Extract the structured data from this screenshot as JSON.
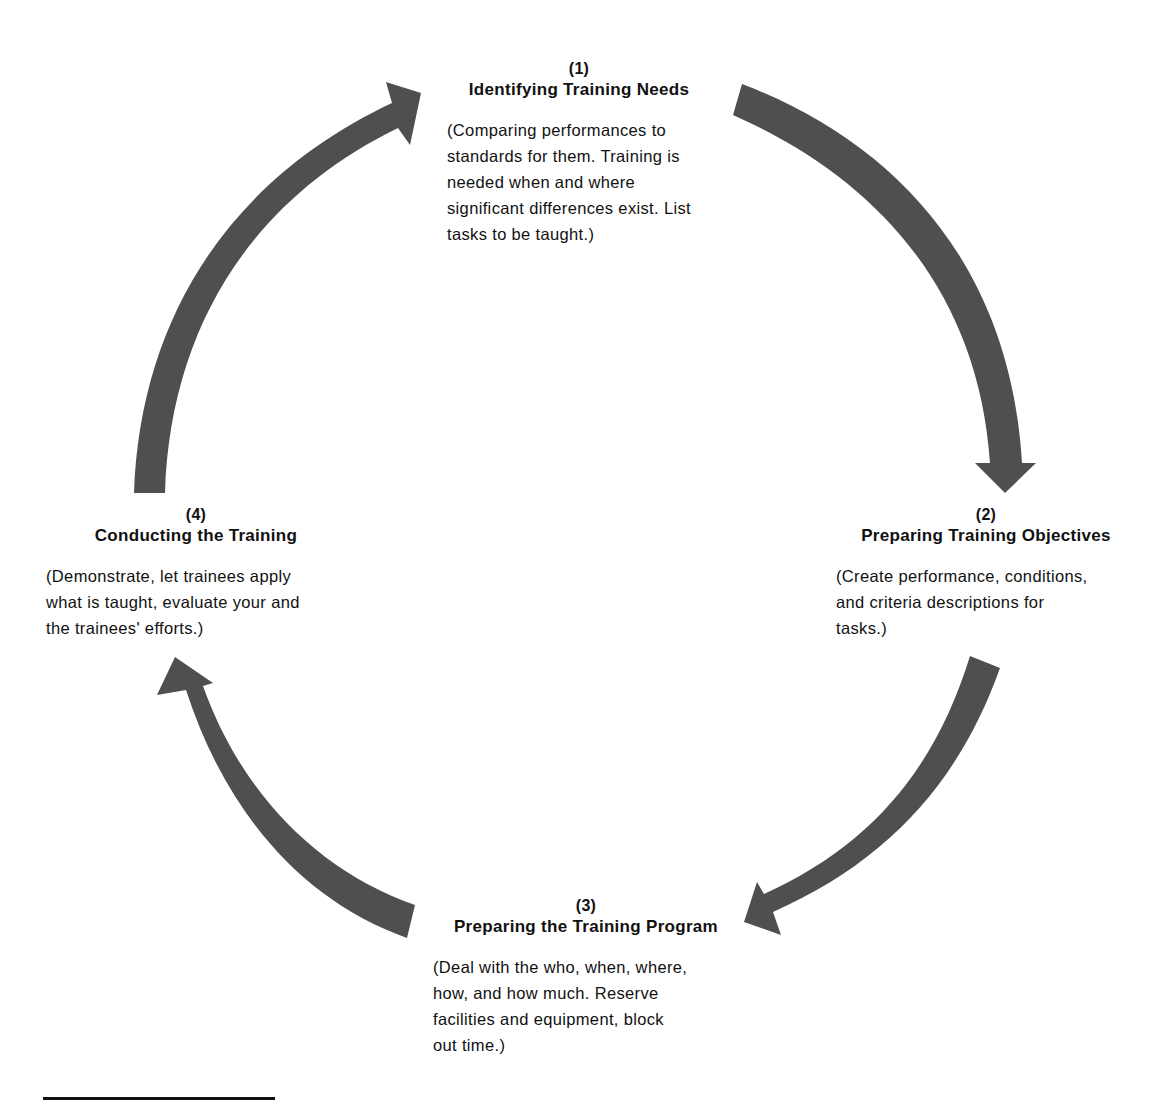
{
  "diagram": {
    "type": "cycle",
    "arrow_color": "#4f4f4f",
    "nodes": [
      {
        "number": "(1)",
        "title": "Identifying Training Needs",
        "description": "(Comparing performances to\nstandards for them. Training is\nneeded when and where\nsignificant differences exist. List\ntasks to be taught.)"
      },
      {
        "number": "(2)",
        "title": "Preparing Training Objectives",
        "description": "(Create performance, conditions,\nand criteria descriptions for\ntasks.)"
      },
      {
        "number": "(3)",
        "title": "Preparing the Training Program",
        "description": "(Deal with the who, when, where,\nhow, and how much. Reserve\nfacilities and equipment, block\nout time.)"
      },
      {
        "number": "(4)",
        "title": "Conducting the Training",
        "description": "(Demonstrate, let trainees apply\nwhat is taught, evaluate your and\nthe trainees' efforts.)"
      }
    ],
    "edges": [
      {
        "from": "(1)",
        "to": "(2)"
      },
      {
        "from": "(2)",
        "to": "(3)"
      },
      {
        "from": "(3)",
        "to": "(4)"
      },
      {
        "from": "(4)",
        "to": "(1)"
      }
    ]
  }
}
